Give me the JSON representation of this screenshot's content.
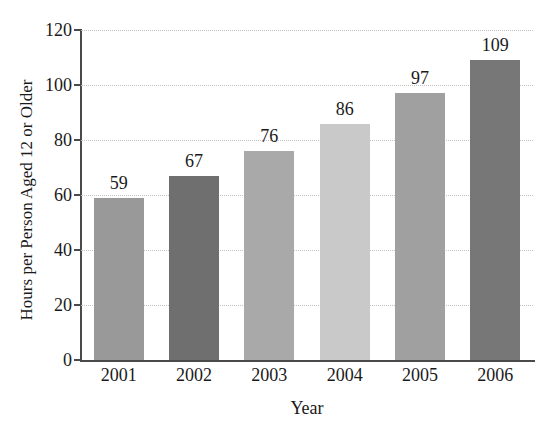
{
  "chart_data": {
    "type": "bar",
    "title": "",
    "cropped_title_fragment": "",
    "categories": [
      "2001",
      "2002",
      "2003",
      "2004",
      "2005",
      "2006"
    ],
    "values": [
      59,
      67,
      76,
      86,
      97,
      109
    ],
    "value_labels": [
      "59",
      "67",
      "76",
      "86",
      "97",
      "109"
    ],
    "xlabel": "Year",
    "ylabel": "Hours per Person Aged 12 or Older",
    "ylim": [
      0,
      120
    ],
    "yticks": [
      0,
      20,
      40,
      60,
      80,
      100,
      120
    ],
    "ytick_labels": [
      "0",
      "20",
      "40",
      "60",
      "80",
      "100",
      "120"
    ],
    "grid": "horizontal-dotted",
    "legend": "none",
    "bar_colors": [
      "#999999",
      "#6f6f6f",
      "#a9a9a9",
      "#c9c9c9",
      "#a0a0a0",
      "#777777"
    ],
    "axis_color": "#4a4a4a",
    "gridline_color": "#c2c2c2",
    "background": "#ffffff"
  }
}
